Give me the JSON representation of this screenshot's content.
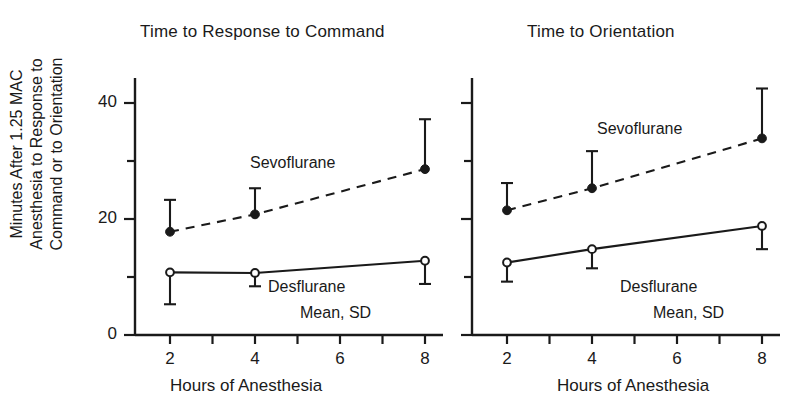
{
  "figure": {
    "y_axis_label": "Minutes After 1.25 MAC\nAnesthesia to Response to\nCommand or to Orientation",
    "x_axis_label": "Hours of Anesthesia",
    "legend_note": "Mean, SD",
    "series_labels": {
      "sevoflurane": "Sevoflurane",
      "desflurane": "Desflurane"
    },
    "colors": {
      "ink": "#1a1a1a",
      "background": "#ffffff"
    }
  },
  "panels": [
    {
      "title": "Time to Response to Command"
    },
    {
      "title": "Time to Orientation"
    }
  ],
  "y_ticks": [
    {
      "value": 0,
      "label": "0"
    },
    {
      "value": 10,
      "label": ""
    },
    {
      "value": 20,
      "label": "20"
    },
    {
      "value": 30,
      "label": ""
    },
    {
      "value": 40,
      "label": "40"
    }
  ],
  "x_ticks": [
    {
      "value": 2,
      "label": "2"
    },
    {
      "value": 3,
      "label": ""
    },
    {
      "value": 4,
      "label": "4"
    },
    {
      "value": 5,
      "label": ""
    },
    {
      "value": 6,
      "label": "6"
    },
    {
      "value": 7,
      "label": ""
    },
    {
      "value": 8,
      "label": "8"
    }
  ],
  "chart_data": [
    {
      "type": "line",
      "title": "Time to Response to Command",
      "xlabel": "Hours of Anesthesia",
      "ylabel": "Minutes After 1.25 MAC Anesthesia to Response to Command or to Orientation",
      "xlim": [
        1.4,
        8.6
      ],
      "ylim": [
        0,
        44
      ],
      "grid": false,
      "legend": "inline-annotation",
      "annotations": [
        "Sevoflurane",
        "Desflurane",
        "Mean, SD"
      ],
      "x": [
        2,
        4,
        8
      ],
      "series": [
        {
          "name": "Sevoflurane",
          "marker": "filled-circle",
          "linestyle": "dashed",
          "values": [
            17.8,
            20.8,
            28.6
          ],
          "sd": [
            5.5,
            4.5,
            8.6
          ],
          "error_direction": "up"
        },
        {
          "name": "Desflurane",
          "marker": "open-circle",
          "linestyle": "solid",
          "values": [
            10.8,
            10.7,
            12.8
          ],
          "sd": [
            5.5,
            2.3,
            4.0
          ],
          "error_direction": "down"
        }
      ]
    },
    {
      "type": "line",
      "title": "Time to Orientation",
      "xlabel": "Hours of Anesthesia",
      "ylabel": "Minutes After 1.25 MAC Anesthesia to Response to Command or to Orientation",
      "xlim": [
        1.4,
        8.6
      ],
      "ylim": [
        0,
        44
      ],
      "grid": false,
      "legend": "inline-annotation",
      "annotations": [
        "Sevoflurane",
        "Desflurane",
        "Mean, SD"
      ],
      "x": [
        2,
        4,
        8
      ],
      "series": [
        {
          "name": "Sevoflurane",
          "marker": "filled-circle",
          "linestyle": "dashed",
          "values": [
            21.5,
            25.3,
            33.9
          ],
          "sd": [
            4.7,
            6.4,
            8.6
          ],
          "error_direction": "up"
        },
        {
          "name": "Desflurane",
          "marker": "open-circle",
          "linestyle": "solid",
          "values": [
            12.5,
            14.8,
            18.8
          ],
          "sd": [
            3.3,
            3.3,
            4.0
          ],
          "error_direction": "down"
        }
      ]
    }
  ]
}
